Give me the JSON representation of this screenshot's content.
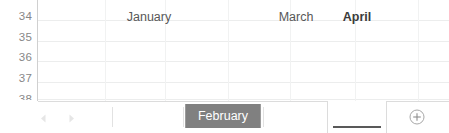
{
  "app": {
    "kind": "spreadsheet-sheet-tab-bar"
  },
  "grid": {
    "row_headers": [
      "34",
      "35",
      "36",
      "37",
      "38"
    ],
    "row_header_partial_last": true,
    "gridline_color": "#eceded",
    "header_text_color": "#878787",
    "background": "#ffffff"
  },
  "tabbar": {
    "nav": {
      "prev_label": "◀",
      "next_label": "▶",
      "prev_name": "previous-sheet-arrow",
      "next_name": "next-sheet-arrow",
      "color": "#e8e8e8"
    },
    "tabs": [
      {
        "label": "January",
        "state": "normal"
      },
      {
        "label": "February",
        "state": "selected"
      },
      {
        "label": "March",
        "state": "normal"
      },
      {
        "label": "April",
        "state": "active"
      }
    ],
    "add_sheet": {
      "icon": "circle-plus-icon",
      "label": "⊕"
    },
    "colors": {
      "selected_bg": "#808080",
      "selected_text": "#ffffff",
      "active_text": "#3b3b3b",
      "active_underline": "#595959",
      "normal_text": "#585858",
      "separator": "#e2e2e2",
      "topline": "#dcdcdc"
    }
  }
}
